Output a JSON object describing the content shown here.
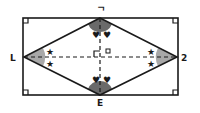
{
  "diagram": {
    "type": "rhombus inscribed in rectangle",
    "labels": {
      "top": "ᄀ",
      "left": "L",
      "right": "2",
      "bottom": "E",
      "center": "O"
    },
    "markers": {
      "star": "★",
      "heart": "♥"
    },
    "colors": {
      "stroke": "#1a1a1a",
      "angle_fill_top": "#6a6a6a",
      "angle_fill_side": "#a8a8a8"
    }
  }
}
